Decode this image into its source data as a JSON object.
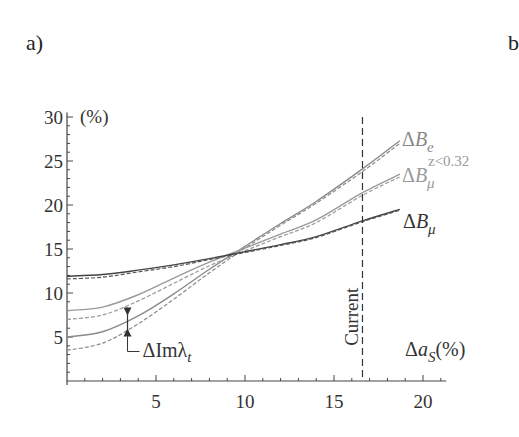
{
  "panel_labels": {
    "a": "a)",
    "b": "b"
  },
  "chart_data": {
    "type": "line",
    "title": "",
    "xlabel": "Δa_S(%)",
    "xlabel_main": "Δa",
    "xlabel_sub": "S",
    "xlabel_unit": "(%)",
    "ylabel": "(%)",
    "xlim": [
      0,
      21.3
    ],
    "ylim": [
      0,
      30.5
    ],
    "xticks": [
      5,
      10,
      15,
      20
    ],
    "yticks": [
      5,
      10,
      15,
      20,
      25,
      30
    ],
    "grid": false,
    "legend_position": "inline-right",
    "x": [
      0,
      2,
      4,
      6,
      8,
      10,
      12,
      14,
      16.6,
      18.7
    ],
    "series": [
      {
        "name": "ΔB_e",
        "label_main": "ΔB",
        "label_sub": "e",
        "label_sup": "",
        "style": "solid",
        "color": "#8a8a8a",
        "values": [
          5.0,
          5.6,
          7.4,
          9.9,
          12.7,
          15.3,
          17.9,
          20.4,
          24.1,
          27.3
        ]
      },
      {
        "name": "ΔB_e (dashed)",
        "style": "dashed",
        "color": "#8a8a8a",
        "values": [
          3.5,
          4.3,
          6.5,
          9.3,
          12.3,
          15.1,
          17.7,
          20.2,
          23.8,
          27.0
        ]
      },
      {
        "name": "ΔB_μ^{z<0.32}",
        "label_main": "ΔB",
        "label_sub": "μ",
        "label_sup": "z<0.32",
        "style": "solid",
        "color": "#9a9a9a",
        "values": [
          8.0,
          8.4,
          9.8,
          11.7,
          13.5,
          15.1,
          16.7,
          18.3,
          21.4,
          23.5
        ]
      },
      {
        "name": "ΔB_μ^{z<0.32} (dashed)",
        "style": "dashed",
        "color": "#9a9a9a",
        "values": [
          7.0,
          7.5,
          9.1,
          11.1,
          13.1,
          14.8,
          16.4,
          18.0,
          21.1,
          23.2
        ]
      },
      {
        "name": "ΔB_μ",
        "label_main": "ΔB",
        "label_sub": "μ",
        "label_sup": "",
        "style": "solid",
        "color": "#444444",
        "values": [
          11.9,
          12.1,
          12.6,
          13.2,
          13.9,
          14.7,
          15.5,
          16.4,
          18.2,
          19.5
        ]
      },
      {
        "name": "ΔB_μ (dashed)",
        "style": "dashed",
        "color": "#555555",
        "values": [
          11.6,
          11.8,
          12.4,
          13.0,
          13.8,
          14.6,
          15.4,
          16.3,
          18.1,
          19.4
        ]
      }
    ],
    "annotations": [
      {
        "type": "vline",
        "x": 16.6,
        "label": "Current",
        "style": "dashed"
      },
      {
        "type": "arrow-range",
        "x": 3.4,
        "y_top": 7.5,
        "y_bottom": 6.0,
        "label_main": "ΔImλ",
        "label_sub": "t"
      }
    ]
  }
}
